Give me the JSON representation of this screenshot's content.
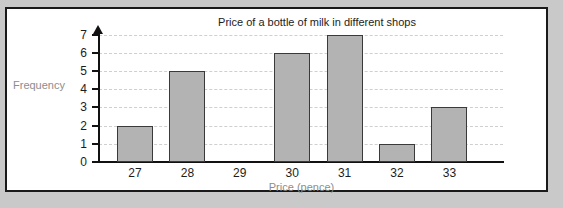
{
  "chart_data": {
    "type": "bar",
    "title": "Price of a bottle of milk in different shops",
    "xlabel": "Price (pence)",
    "ylabel": "Frequency",
    "categories": [
      "27",
      "28",
      "29",
      "30",
      "31",
      "32",
      "33"
    ],
    "values": [
      2,
      5,
      0,
      6,
      7,
      1,
      3
    ],
    "series": [
      {
        "name": "Frequency",
        "values": [
          2,
          5,
          0,
          6,
          7,
          1,
          3
        ]
      }
    ],
    "ylim": [
      0,
      7
    ],
    "y_ticks": [
      "0",
      "1",
      "2",
      "3",
      "4",
      "5",
      "6",
      "7"
    ],
    "x_ticks": [
      "27",
      "28",
      "29",
      "30",
      "31",
      "32",
      "33"
    ],
    "grid": true,
    "grid_style": "horizontal-dashed",
    "legend": null,
    "legend_position": "none",
    "colors": {
      "bar_fill": "#b3b3b3",
      "bar_border": "#3a3a3a",
      "gridline": "#cfcfcf",
      "axis": "#111111",
      "title_text": "#1c1c1c",
      "tick_text": "#1c1c1c",
      "axis_title_text": "#8d8d8d",
      "page_background": "#c9c9c9",
      "plot_background": "#ffffff",
      "frame_border": "#1a1a1a"
    }
  }
}
